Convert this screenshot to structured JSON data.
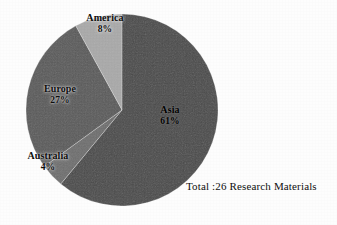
{
  "figure": {
    "background_color": "#fdfdfd",
    "caption": "Total :26 Research Materials"
  },
  "chart_data": {
    "type": "pie",
    "title": "",
    "total_label": "Total :26 Research Materials",
    "total_count": 26,
    "units": "Research Materials",
    "legend_position": "none",
    "labels_inline": true,
    "start_angle_deg": 0,
    "direction": "clockwise",
    "slices": [
      {
        "name": "Asia",
        "label": "Asia",
        "percent": 61,
        "percent_label": "61%",
        "color": "#4a4a4a"
      },
      {
        "name": "Australia",
        "label": "Australia",
        "percent": 4,
        "percent_label": "4%",
        "color": "#6e6e6e"
      },
      {
        "name": "Europe",
        "label": "Europe",
        "percent": 27,
        "percent_label": "27%",
        "color": "#5a5a5a"
      },
      {
        "name": "America",
        "label": "America",
        "percent": 8,
        "percent_label": "8%",
        "color": "#a9a9a9"
      }
    ],
    "categories": [
      "Asia",
      "Australia",
      "Europe",
      "America"
    ],
    "values": [
      61,
      4,
      27,
      8
    ]
  },
  "geometry": {
    "center_x": 122,
    "center_y": 110,
    "radius": 96
  }
}
